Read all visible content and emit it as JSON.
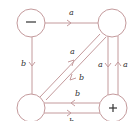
{
  "diagram": {
    "colors": {
      "edge": "#c49a9c",
      "text": "#333333",
      "background": "#ffffff"
    },
    "nodes": [
      {
        "id": "top-left",
        "sign": "−"
      },
      {
        "id": "top-right",
        "sign": ""
      },
      {
        "id": "bottom-left",
        "sign": ""
      },
      {
        "id": "bottom-right",
        "sign": "+"
      }
    ],
    "edges": [
      {
        "from": "top-left",
        "to": "top-right",
        "label": "a"
      },
      {
        "from": "top-left",
        "to": "bottom-left",
        "label": "b"
      },
      {
        "from": "bottom-left",
        "to": "top-right",
        "label": "a"
      },
      {
        "from": "top-right",
        "to": "bottom-left",
        "label": "b"
      },
      {
        "from": "top-right",
        "to": "bottom-right",
        "label": "a"
      },
      {
        "from": "bottom-right",
        "to": "top-right",
        "label": "a"
      },
      {
        "from": "bottom-right",
        "to": "bottom-left",
        "label": "b"
      },
      {
        "from": "bottom-left",
        "to": "bottom-right",
        "label": "b"
      }
    ]
  }
}
